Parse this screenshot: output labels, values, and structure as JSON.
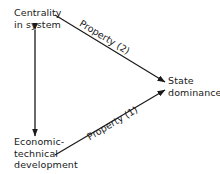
{
  "diagram": {
    "nodes": {
      "centrality": {
        "lines": [
          "Centrality",
          "in system"
        ]
      },
      "economic": {
        "lines": [
          "Economic-",
          "technical",
          "development"
        ]
      },
      "state": {
        "lines": [
          "State",
          "dominance"
        ]
      }
    },
    "edges": {
      "property2": {
        "label": "Property (2)",
        "from": "Centrality in system",
        "to": "State dominance"
      },
      "property1": {
        "label": "Property (1)",
        "from": "Economic-technical development",
        "to": "State dominance"
      },
      "mutual": {
        "label": "",
        "from": "Centrality in system",
        "to": "Economic-technical development",
        "bidirectional": true
      }
    },
    "colors": {
      "ink": "#1a1a1a",
      "background": "#ffffff"
    }
  }
}
